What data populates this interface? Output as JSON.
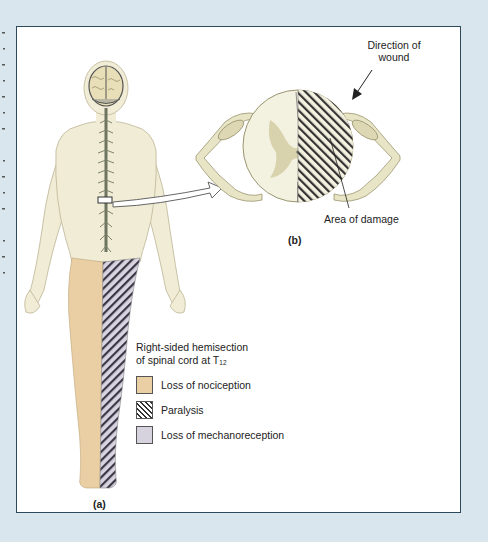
{
  "figure": {
    "panel_a_label": "(a)",
    "panel_b_label": "(b)",
    "cross_section": {
      "direction_label_line1": "Direction of",
      "direction_label_line2": "wound",
      "damage_label": "Area of damage"
    },
    "legend": {
      "title_line1": "Right-sided hemisection",
      "title_line2": "of spinal cord at T",
      "title_subscript": "12",
      "items": [
        {
          "label": "Loss of nociception",
          "swatch": "tan",
          "color": "#e9cfa3"
        },
        {
          "label": "Paralysis",
          "swatch": "diagonal-hatch",
          "color": "#333333"
        },
        {
          "label": "Loss of mechanoreception",
          "swatch": "lavender",
          "color": "#d7d3de"
        }
      ]
    },
    "colors": {
      "page_background": "#d9e6ee",
      "panel_border": "#2c4a5c",
      "skin": "#f1ecd6",
      "nerve": "#cfcba4",
      "grey_matter": "#d8d2ad"
    }
  }
}
